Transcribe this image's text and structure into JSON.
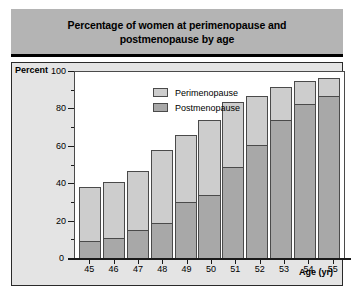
{
  "title": {
    "line1": "Percentage of women at perimenopause and",
    "line2": "postmenopause by age"
  },
  "axes": {
    "y_title": "Percent",
    "x_title": "Age (yr)",
    "zero_label": "0"
  },
  "legend": {
    "items": [
      {
        "label": "Perimenopause",
        "color": "#cdcdcd"
      },
      {
        "label": "Postmenopause",
        "color": "#a8a8a8"
      }
    ]
  },
  "chart_data": {
    "type": "bar",
    "stacked": true,
    "title": "Percentage of women at perimenopause and postmenopause by age",
    "xlabel": "Age (yr)",
    "ylabel": "Percent",
    "ylim": [
      0,
      100
    ],
    "yticks": [
      0,
      20,
      40,
      60,
      80,
      100
    ],
    "ytick_labels": [
      "0",
      "20",
      "40",
      "60",
      "80",
      "100"
    ],
    "yminor_ticks": [
      10,
      30,
      50,
      70,
      90
    ],
    "grid": false,
    "legend_position": "upper-left-inside",
    "categories": [
      "45",
      "46",
      "47",
      "48",
      "49",
      "50",
      "51",
      "52",
      "53",
      "54",
      "55"
    ],
    "series": [
      {
        "name": "Postmenopause",
        "color": "#a8a8a8",
        "values": [
          9,
          11,
          15,
          19,
          30,
          34,
          49,
          61,
          74,
          83,
          87
        ]
      },
      {
        "name": "Perimenopause",
        "color": "#cdcdcd",
        "values": [
          29,
          30,
          32,
          39,
          36,
          40,
          35,
          26,
          18,
          12,
          10
        ]
      }
    ],
    "totals": [
      38,
      41,
      47,
      58,
      66,
      74,
      84,
      87,
      92,
      95,
      97
    ]
  }
}
